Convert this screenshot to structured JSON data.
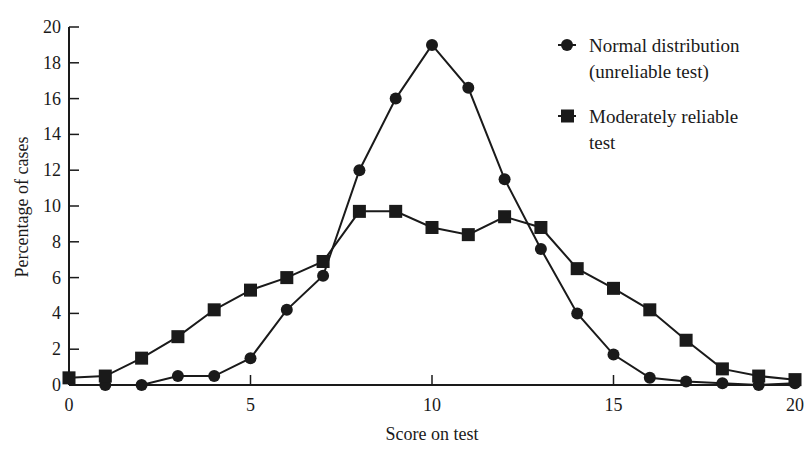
{
  "chart_data": {
    "type": "line",
    "title": "",
    "xlabel": "Score on test",
    "ylabel": "Percentage of cases",
    "xlim": [
      0,
      20
    ],
    "ylim": [
      0,
      20
    ],
    "x_ticks": [
      0,
      5,
      10,
      15,
      20
    ],
    "y_ticks": [
      0,
      2,
      4,
      6,
      8,
      10,
      12,
      14,
      16,
      18,
      20
    ],
    "grid": false,
    "legend_position": "upper right",
    "x": [
      0,
      1,
      2,
      3,
      4,
      5,
      6,
      7,
      8,
      9,
      10,
      11,
      12,
      13,
      14,
      15,
      16,
      17,
      18,
      19,
      20
    ],
    "series": [
      {
        "name": "Normal distribution (unreliable test)",
        "legend_lines": [
          "Normal distribution",
          "(unreliable test)"
        ],
        "marker": "circle",
        "x": [
          1,
          2,
          3,
          4,
          5,
          6,
          7,
          8,
          9,
          10,
          11,
          12,
          13,
          14,
          15,
          16,
          17,
          18,
          19,
          20
        ],
        "values": [
          0,
          0,
          0.5,
          0.5,
          1.5,
          4.2,
          6.1,
          12,
          16,
          19,
          16.6,
          11.5,
          7.6,
          4,
          1.7,
          0.4,
          0.2,
          0.1,
          0,
          0.1
        ]
      },
      {
        "name": "Moderately reliable test",
        "legend_lines": [
          "Moderately reliable",
          "test"
        ],
        "marker": "square",
        "x": [
          0,
          1,
          2,
          3,
          4,
          5,
          6,
          7,
          8,
          9,
          10,
          11,
          12,
          13,
          14,
          15,
          16,
          17,
          18,
          19,
          20
        ],
        "values": [
          0.4,
          0.5,
          1.5,
          2.7,
          4.2,
          5.3,
          6,
          6.9,
          9.7,
          9.7,
          8.8,
          8.4,
          9.4,
          8.8,
          6.5,
          5.4,
          4.2,
          2.5,
          0.9,
          0.5,
          0.3
        ]
      }
    ]
  }
}
